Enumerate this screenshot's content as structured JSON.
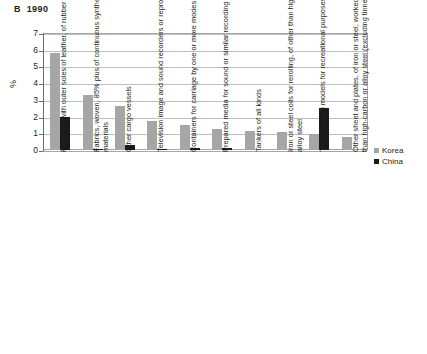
{
  "chart_data": {
    "type": "bar",
    "title": "B  1990",
    "xlabel": "",
    "ylabel": "%",
    "ylim": [
      0,
      7
    ],
    "yticks": [
      0,
      1,
      2,
      3,
      4,
      5,
      6,
      7
    ],
    "grid": true,
    "legend_position": "right",
    "categories": [
      "Footwear with outer soles of leather, of rubber or plastic",
      "Fabrics, woven, 85% plus of continuous synthetic textile materials",
      "Other cargo vessels",
      "Television image and sound recorders or reproducers",
      "Containers for carriage by one or more modes of transport",
      "Prepared media for sound or similar recording",
      "Tankers of all kinds",
      "Iron or steel coils for rerolling, of other than high carbon or alloy steel",
      "Toys; working models for recreational purposes",
      "Other sheet and plates, of iron or steel, worked; of other than high-carbon or alloy steel (excluding tinned)"
    ],
    "series": [
      {
        "name": "Korea",
        "color": "#a6a6a6",
        "values": [
          5.8,
          3.3,
          2.65,
          1.75,
          1.5,
          1.28,
          1.15,
          1.1,
          0.95,
          0.8
        ]
      },
      {
        "name": "China",
        "color": "#1a1a1a",
        "values": [
          1.95,
          0.05,
          0.3,
          0.05,
          0.1,
          0.15,
          0,
          0,
          2.5,
          0
        ]
      }
    ]
  }
}
